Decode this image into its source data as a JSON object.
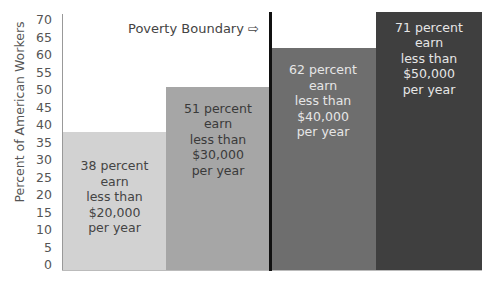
{
  "chart_data": {
    "type": "bar",
    "title": "",
    "xlabel": "",
    "ylabel": "Percent of American Workers",
    "ylim": [
      0,
      70
    ],
    "yticks": [
      0,
      5,
      10,
      15,
      20,
      25,
      30,
      35,
      40,
      45,
      50,
      55,
      60,
      65,
      70
    ],
    "grid": false,
    "categories": [
      "less than $20,000",
      "less than $30,000",
      "less than $40,000",
      "less than $50,000"
    ],
    "values": [
      38,
      51,
      62,
      71
    ],
    "bar_labels": [
      "38 percent\nearn\nless than\n$20,000\nper year",
      "51 percent\nearn\nless than\n$30,000\nper year",
      "62 percent\nearn\nless than\n$40,000\nper year",
      "71 percent\nearn\nless than\n$50,000\nper year"
    ],
    "bar_colors": [
      "#d2d2d2",
      "#a6a6a6",
      "#6e6e6e",
      "#3f3f3f"
    ],
    "label_colors": [
      "#444444",
      "#3a3a3a",
      "#e6e6e6",
      "#e6e6e6"
    ],
    "annotations": [
      {
        "text": "Poverty Boundary ⇨",
        "position": "between bar 2 and bar 3",
        "line": "vertical black divider"
      }
    ]
  }
}
